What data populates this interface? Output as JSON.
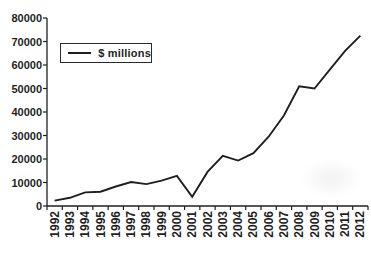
{
  "colors": {
    "ink": "#1f1f1f",
    "background": "#ffffff"
  },
  "chart_data": {
    "type": "line",
    "title": "",
    "x": [
      "1992",
      "1993",
      "1994",
      "1995",
      "1996",
      "1997",
      "1998",
      "1999",
      "2000",
      "2001",
      "2002",
      "2003",
      "2004",
      "2005",
      "2006",
      "2007",
      "2008",
      "2009",
      "2010",
      "2011",
      "2012"
    ],
    "series": [
      {
        "name": "$ millions",
        "values": [
          2300,
          3500,
          5800,
          6100,
          8300,
          10200,
          9300,
          10800,
          12800,
          3900,
          14500,
          21300,
          19300,
          22500,
          29500,
          38500,
          51000,
          50000,
          58000,
          66000,
          72500
        ]
      }
    ],
    "xlabel": "",
    "ylabel": "",
    "ylim": [
      0,
      80000
    ],
    "yticks": [
      0,
      10000,
      20000,
      30000,
      40000,
      50000,
      60000,
      70000,
      80000
    ],
    "ytick_labels": [
      "0",
      "10000",
      "20000",
      "30000",
      "40000",
      "50000",
      "60000",
      "70000",
      "80000"
    ],
    "grid": false,
    "legend_position": "top-left",
    "legend_border": true,
    "x_labels_rotated": true
  }
}
